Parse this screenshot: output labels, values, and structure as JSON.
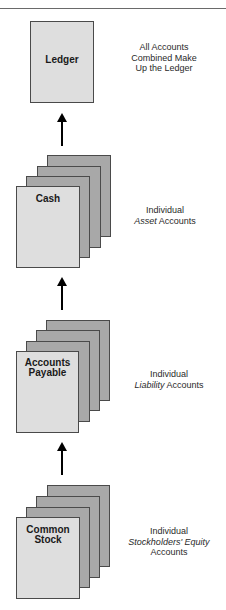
{
  "diagram": {
    "title": "",
    "ledger": {
      "label": "Ledger",
      "caption_lines": [
        "All Accounts",
        "Combined Make",
        "Up the Ledger"
      ]
    },
    "groups": [
      {
        "label_lines": [
          "Cash"
        ],
        "caption_line1": "Individual",
        "caption_italic": "Asset",
        "caption_rest": " Accounts",
        "caption_line3": ""
      },
      {
        "label_lines": [
          "Accounts",
          "Payable"
        ],
        "caption_line1": "Individual",
        "caption_italic": "Liability",
        "caption_rest": " Accounts",
        "caption_line3": ""
      },
      {
        "label_lines": [
          "Common",
          "Stock"
        ],
        "caption_line1": "Individual",
        "caption_italic": "Stockholders' Equity",
        "caption_rest": "",
        "caption_line3": "Accounts"
      }
    ],
    "colors": {
      "front_card": "#dedede",
      "back_card": "#a8a8a8",
      "border": "#4a4a4a",
      "arrow": "#000000"
    }
  }
}
